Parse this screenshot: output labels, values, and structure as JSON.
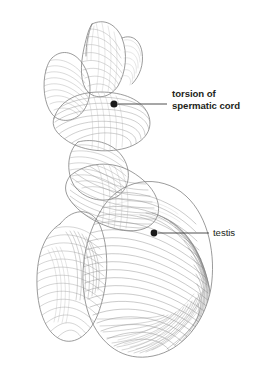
{
  "figure": {
    "kind": "anatomical-line-drawing",
    "background_color": "#ffffff",
    "ink_color": "#6b6b6b",
    "dark_ink_color": "#4a4a4a",
    "label_color": "#231f20",
    "leader_color": "#3a3a3a"
  },
  "callouts": [
    {
      "id": "torsion",
      "name": "torsion-of-spermatic-cord",
      "lines": [
        "torsion of",
        "spermatic cord"
      ],
      "text": "torsion of\nspermatic cord",
      "weight": "bold",
      "dot": {
        "x": 114,
        "y": 104,
        "r": 3.6
      },
      "leader": {
        "x1": 118,
        "y1": 104,
        "x2": 167,
        "y2": 104
      }
    },
    {
      "id": "testis",
      "name": "testis",
      "lines": [
        "testis"
      ],
      "text": "testis",
      "weight": "normal",
      "dot": {
        "x": 154,
        "y": 233,
        "r": 3.4
      },
      "leader": {
        "x1": 158,
        "y1": 233,
        "x2": 209,
        "y2": 233
      }
    }
  ]
}
